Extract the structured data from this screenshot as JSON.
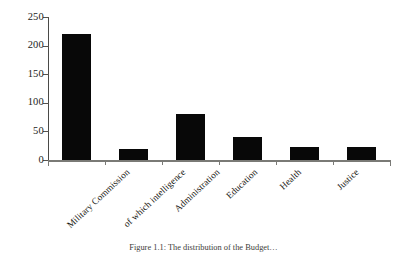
{
  "chart_data": {
    "type": "bar",
    "title": "",
    "xlabel": "",
    "ylabel": "",
    "categories": [
      "Military Commission",
      "of which intelligence",
      "Administration",
      "Education",
      "Health",
      "Justice"
    ],
    "values": [
      220,
      20,
      80,
      40,
      22,
      22
    ],
    "ylim": [
      0,
      250
    ],
    "yticks": [
      0,
      50,
      100,
      150,
      200,
      250
    ],
    "ytick_labels": [
      "0",
      "50",
      "100",
      "150",
      "200",
      "250"
    ],
    "grid": false,
    "legend": "none",
    "bar_color": "#080808",
    "axis_color": "#7a7a76",
    "label_rotation_deg": -43
  },
  "figure": {
    "caption": "Figure 1.1: The distribution of the Budget…"
  }
}
